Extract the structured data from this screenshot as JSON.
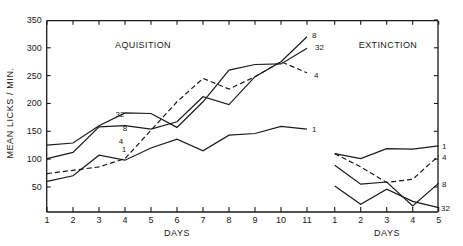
{
  "chart_data": {
    "type": "line",
    "ylabel": "MEAN LICKS / MIN.",
    "ylim": [
      0,
      350
    ],
    "yticks": [
      50,
      100,
      150,
      200,
      250,
      300,
      350
    ],
    "grid": false,
    "legend": "inline labels at line ends",
    "panels": [
      {
        "title": "AQUISITION",
        "xlabel": "DAYS",
        "x": [
          1,
          2,
          3,
          4,
          5,
          6,
          7,
          8,
          9,
          10,
          11
        ],
        "series": [
          {
            "name": "32",
            "style": "solid",
            "values": [
              125,
              129,
              160,
              183,
              182,
              157,
              203,
              260,
              270,
              271,
              299
            ]
          },
          {
            "name": "8",
            "style": "solid",
            "values": [
              101,
              112,
              158,
              160,
              154,
              167,
              212,
              198,
              248,
              275,
              320
            ]
          },
          {
            "name": "4",
            "style": "dashed",
            "values": [
              74,
              80,
              86,
              101,
              152,
              203,
              245,
              226,
              248,
              275,
              255
            ]
          },
          {
            "name": "1",
            "style": "solid",
            "values": [
              60,
              70,
              107,
              98,
              120,
              136,
              115,
              143,
              146,
              159,
              154
            ]
          }
        ]
      },
      {
        "title": "EXTINCTION",
        "xlabel": "DAYS",
        "x": [
          1,
          2,
          3,
          4,
          5
        ],
        "series": [
          {
            "name": "1",
            "style": "solid",
            "values": [
              110,
              101,
              119,
              118,
              124
            ]
          },
          {
            "name": "4",
            "style": "dashed",
            "values": [
              110,
              86,
              58,
              64,
              106
            ]
          },
          {
            "name": "8",
            "style": "solid",
            "values": [
              89,
              55,
              59,
              16,
              57
            ]
          },
          {
            "name": "32",
            "style": "solid",
            "values": [
              52,
              19,
              46,
              24,
              13
            ]
          }
        ]
      }
    ]
  },
  "labels": {
    "ylabel": "MEAN LICKS / MIN.",
    "acq_title": "AQUISITION",
    "ext_title": "EXTINCTION",
    "acq_xlabel": "DAYS",
    "ext_xlabel": "DAYS"
  }
}
